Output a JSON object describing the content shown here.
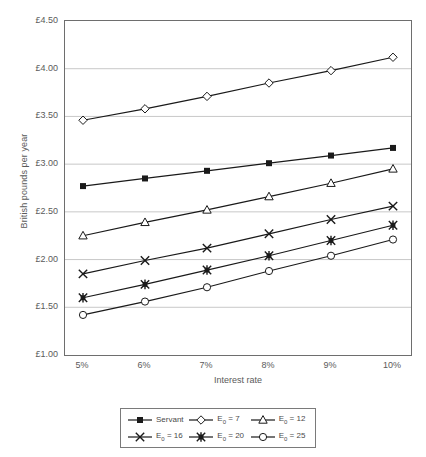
{
  "chart_data": {
    "type": "line",
    "title": "",
    "xlabel": "Interest rate",
    "ylabel": "British pounds per year",
    "categories": [
      "5%",
      "6%",
      "7%",
      "8%",
      "9%",
      "10%"
    ],
    "x": [
      5,
      6,
      7,
      8,
      9,
      10
    ],
    "ylim": [
      1.0,
      4.5
    ],
    "ytick_labels": [
      "£1.00",
      "£1.50",
      "£2.00",
      "£2.50",
      "£3.00",
      "£3.50",
      "£4.00",
      "£4.50"
    ],
    "ytick_values": [
      1.0,
      1.5,
      2.0,
      2.5,
      3.0,
      3.5,
      4.0,
      4.5
    ],
    "grid": "horizontal",
    "legend_position": "bottom",
    "legend_columns": 3,
    "series": [
      {
        "name": "Servant",
        "marker": "filled-square",
        "values": [
          2.77,
          2.85,
          2.93,
          3.01,
          3.09,
          3.17
        ]
      },
      {
        "name": "E₀ = 7",
        "marker": "open-diamond",
        "values": [
          3.46,
          3.58,
          3.71,
          3.85,
          3.98,
          4.12
        ]
      },
      {
        "name": "E₀ = 12",
        "marker": "open-triangle",
        "values": [
          2.25,
          2.39,
          2.52,
          2.66,
          2.8,
          2.95
        ]
      },
      {
        "name": "E₀ = 16",
        "marker": "cross",
        "values": [
          1.85,
          1.99,
          2.12,
          2.27,
          2.42,
          2.56
        ]
      },
      {
        "name": "E₀ = 20",
        "marker": "filled-star",
        "values": [
          1.6,
          1.74,
          1.89,
          2.04,
          2.2,
          2.36
        ]
      },
      {
        "name": "E₀ = 25",
        "marker": "open-circle",
        "values": [
          1.42,
          1.56,
          1.71,
          1.88,
          2.04,
          2.21
        ]
      }
    ]
  },
  "legend": {
    "entries": [
      {
        "label": "Servant",
        "base": "Servant",
        "sub": "",
        "tail": ""
      },
      {
        "label": "E0 = 7",
        "base": "E",
        "sub": "0",
        "tail": " = 7"
      },
      {
        "label": "E0 = 12",
        "base": "E",
        "sub": "0",
        "tail": " = 12"
      },
      {
        "label": "E0 = 16",
        "base": "E",
        "sub": "0",
        "tail": " = 16"
      },
      {
        "label": "E0 = 20",
        "base": "E",
        "sub": "0",
        "tail": " = 20"
      },
      {
        "label": "E0 = 25",
        "base": "E",
        "sub": "0",
        "tail": " = 25"
      }
    ]
  },
  "colors": {
    "line": "#1a1a1a",
    "grid": "#c8c8c8",
    "frame": "#6e6e6e",
    "text": "#4a4a4a",
    "background": "#ffffff"
  }
}
